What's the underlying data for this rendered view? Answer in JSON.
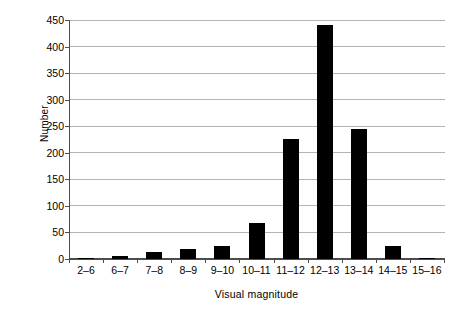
{
  "chart_data": {
    "type": "bar",
    "title": "",
    "xlabel": "Visual magnitude",
    "ylabel": "Number",
    "categories": [
      "2–6",
      "6–7",
      "7–8",
      "8–9",
      "9–10",
      "10–11",
      "11–12",
      "12–13",
      "13–14",
      "14–15",
      "15–16"
    ],
    "values": [
      1,
      6,
      14,
      18,
      25,
      67,
      226,
      440,
      245,
      25,
      0
    ],
    "ylim": [
      0,
      450
    ],
    "yticks": [
      0,
      50,
      100,
      150,
      200,
      250,
      300,
      350,
      400,
      450
    ],
    "ytick_labels": [
      "0",
      "50",
      "100",
      "150",
      "200",
      "250",
      "300",
      "350",
      "400",
      "450"
    ],
    "grid": true,
    "legend": false,
    "bar_color": "#000000",
    "grid_color": "#b3b3b3",
    "axis_color": "#4d4d4d"
  }
}
